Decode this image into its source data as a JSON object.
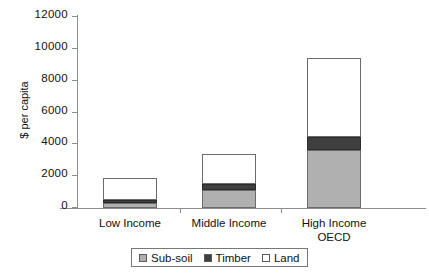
{
  "chart_data": {
    "type": "bar",
    "stacked": true,
    "title": "",
    "xlabel": "",
    "ylabel": "$ per capita",
    "ylim": [
      0,
      12000
    ],
    "yticks": [
      0,
      2000,
      4000,
      6000,
      8000,
      10000,
      12000
    ],
    "ytick_labels": [
      "0",
      "2000",
      "4000",
      "6000",
      "8000",
      "10000",
      "12000"
    ],
    "grid": false,
    "legend_position": "bottom",
    "categories": [
      "Low Income",
      "Middle Income",
      "High Income OECD"
    ],
    "category_label_lines": [
      [
        "Low Income"
      ],
      [
        "Middle Income"
      ],
      [
        "High Income",
        "OECD"
      ]
    ],
    "series": [
      {
        "name": "Sub-soil",
        "color": "#b0b0b0",
        "values": [
          300,
          1150,
          3650
        ]
      },
      {
        "name": "Timber",
        "color": "#3f3f3f",
        "values": [
          200,
          350,
          800
        ]
      },
      {
        "name": "Land",
        "color": "#ffffff",
        "values": [
          1400,
          1900,
          4950
        ]
      }
    ],
    "totals": [
      1900,
      3400,
      9400
    ]
  },
  "legend": {
    "items": [
      {
        "label": "Sub-soil",
        "color": "#b0b0b0"
      },
      {
        "label": "Timber",
        "color": "#3f3f3f"
      },
      {
        "label": "Land",
        "color": "#ffffff"
      }
    ]
  }
}
